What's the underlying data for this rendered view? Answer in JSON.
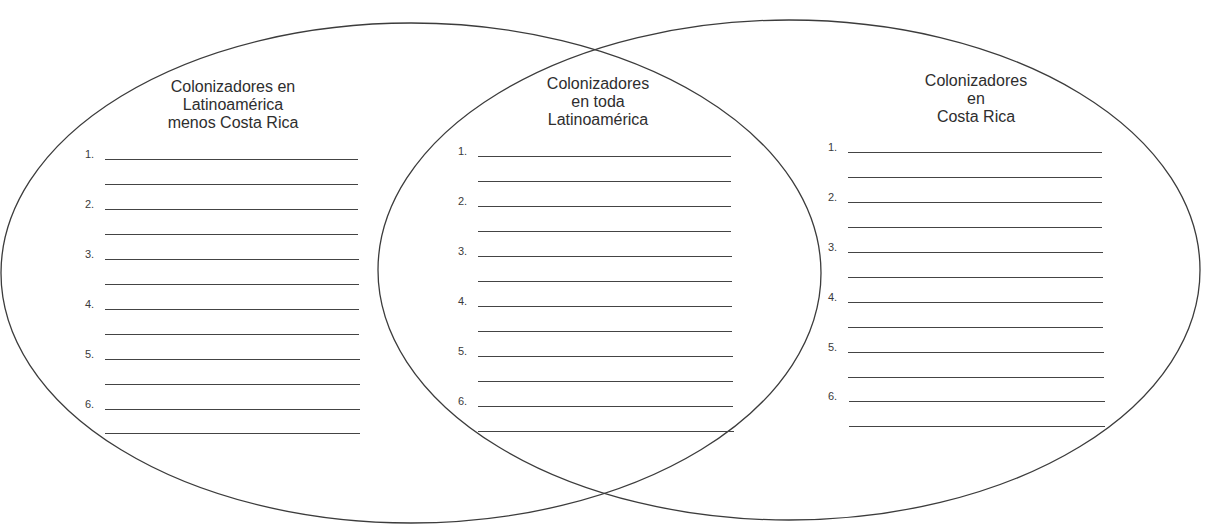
{
  "diagram": {
    "type": "venn",
    "stroke_color": "#3c3c3c",
    "line_color": "#444444",
    "sets": [
      {
        "id": "left",
        "title_lines": [
          "Colonizadores en",
          "Latinoamérica",
          "menos Costa Rica"
        ],
        "items": [
          "1.",
          "2.",
          "3.",
          "4.",
          "5.",
          "6."
        ]
      },
      {
        "id": "center",
        "title_lines": [
          "Colonizadores",
          "en toda",
          "Latinoamérica"
        ],
        "items": [
          "1.",
          "2.",
          "3.",
          "4.",
          "5.",
          "6."
        ]
      },
      {
        "id": "right",
        "title_lines": [
          "Colonizadores",
          "en",
          "Costa Rica"
        ],
        "items": [
          "1.",
          "2.",
          "3.",
          "4.",
          "5.",
          "6."
        ]
      }
    ]
  }
}
